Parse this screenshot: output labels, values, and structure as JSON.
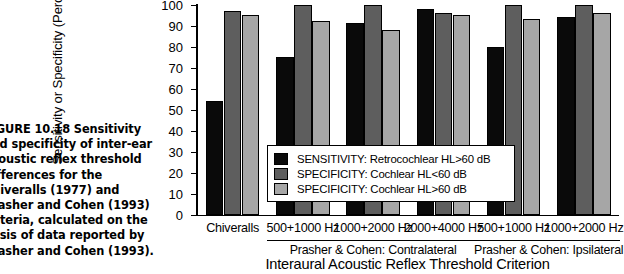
{
  "caption": {
    "lines": [
      "FIGURE 10.18   Sensitivity",
      "and specificity of inter-ear",
      "acoustic reflex threshold",
      "differences for the",
      "Chiveralls (1977) and",
      "Prasher and Cohen (1993)",
      "criteria, calculated on the",
      "basis of data reported by",
      "Prasher and Cohen (1993)."
    ]
  },
  "chart_data": {
    "type": "bar",
    "title": "",
    "xlabel": "Interaural Acoustic Reflex Threshold Criterion",
    "ylabel": "Sensitivity or Specificity (Percent)",
    "ylim": [
      0,
      100
    ],
    "yticks": [
      0,
      10,
      20,
      30,
      40,
      50,
      60,
      70,
      80,
      90,
      100
    ],
    "ytick_labels": [
      "0",
      "10",
      "20",
      "30",
      "40",
      "50",
      "60",
      "70",
      "80",
      "90",
      "100"
    ],
    "grid": false,
    "legend_position": "inside-lower-center",
    "categories": [
      "Chiveralls",
      "500+1000 Hz",
      "1000+2000 Hz",
      "2000+4000 Hz",
      "500+1000 Hz",
      "1000+2000 Hz"
    ],
    "group_brackets": [
      {
        "label": "Prasher & Cohen: Contralateral",
        "categories": [
          1,
          2,
          3
        ]
      },
      {
        "label": "Prasher & Cohen: Ipsilateral",
        "categories": [
          4,
          5
        ]
      }
    ],
    "series": [
      {
        "name": "SENSITIVITY: Retrocochlear HL>60 dB",
        "color": "#0a0a0a",
        "values": [
          54,
          75,
          91,
          98,
          80,
          94
        ]
      },
      {
        "name": "SPECIFICITY: Cochlear HL<60 dB",
        "color": "#5e5e5e",
        "values": [
          97,
          100,
          100,
          96,
          100,
          100
        ]
      },
      {
        "name": "SPECIFICITY: Cochlear HL>60 dB",
        "color": "#a6a6a6",
        "values": [
          95,
          92,
          88,
          95,
          93,
          96
        ]
      }
    ]
  }
}
